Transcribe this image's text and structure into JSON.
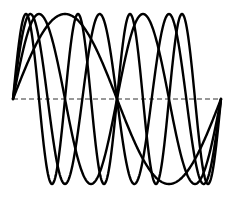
{
  "chart_data": {
    "type": "line",
    "title": "",
    "xlabel": "",
    "ylabel": "",
    "grid": false,
    "legend": null,
    "x_range": [
      0,
      1
    ],
    "ylim": [
      -1,
      1
    ],
    "baseline": {
      "y": 0,
      "style": "dashed"
    },
    "series": [
      {
        "name": "sin(2πt)",
        "half_periods": 2,
        "amplitude": 1
      },
      {
        "name": "sin(4πt)",
        "half_periods": 4,
        "amplitude": 1
      },
      {
        "name": "sin(6πt)",
        "half_periods": 6,
        "amplitude": 1
      },
      {
        "name": "sin(8πt)",
        "half_periods": 8,
        "amplitude": 1
      }
    ],
    "colors": {
      "curve": "#000000",
      "baseline": "#333333"
    }
  },
  "layout": {
    "x0": 13,
    "x1": 221,
    "y_baseline": 99,
    "amplitude_px": 85
  }
}
